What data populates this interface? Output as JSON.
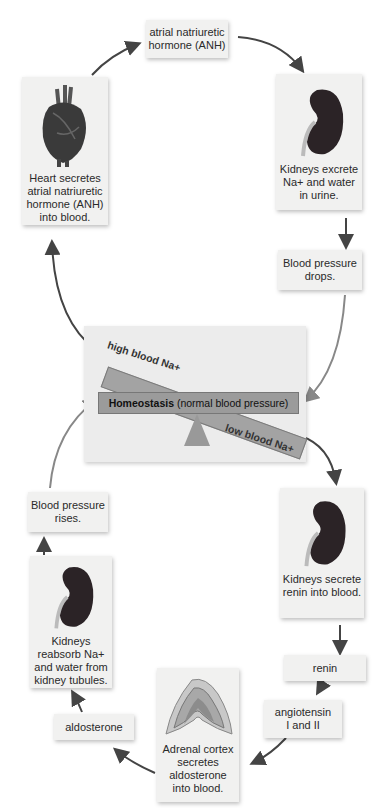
{
  "diagram": {
    "nodes": {
      "anh": {
        "lines": [
          "atrial natriuretic",
          "hormone (ANH)"
        ]
      },
      "heart": {
        "icon": "heart-illustration",
        "lines": [
          "Heart secretes",
          "atrial natriuretic",
          "hormone (ANH)",
          "into blood."
        ]
      },
      "kidney_excrete": {
        "icon": "kidney-illustration",
        "lines": [
          "Kidneys excrete",
          "Na+ and water",
          "in urine."
        ]
      },
      "bp_drops": {
        "lines": [
          "Blood pressure",
          "drops."
        ]
      },
      "kidney_renin": {
        "icon": "kidney-illustration",
        "lines": [
          "Kidneys secrete",
          "renin into blood."
        ]
      },
      "renin": {
        "lines": [
          "renin"
        ]
      },
      "angiotensin": {
        "lines": [
          "angiotensin",
          "I and II"
        ]
      },
      "adrenal": {
        "icon": "adrenal-cortex-illustration",
        "lines": [
          "Adrenal cortex",
          "secretes",
          "aldosterone",
          "into blood."
        ]
      },
      "aldosterone": {
        "lines": [
          "aldosterone"
        ]
      },
      "kidney_reabsorb": {
        "icon": "kidney-illustration",
        "lines": [
          "Kidneys",
          "reabsorb Na+",
          "and water from",
          "kidney tubules."
        ]
      },
      "bp_rises": {
        "lines": [
          "Blood pressure",
          "rises."
        ]
      }
    },
    "balance": {
      "high_label": "high blood Na+",
      "low_label": "low blood Na+",
      "center_bold": "Homeostasis",
      "center_rest": " (normal blood pressure)"
    },
    "colors": {
      "box_bg": "#f1f1f0",
      "panel_bg": "#ececec",
      "beam": "#9b9b9b",
      "arrow": "#444444",
      "kidney": "#2b2326"
    }
  }
}
